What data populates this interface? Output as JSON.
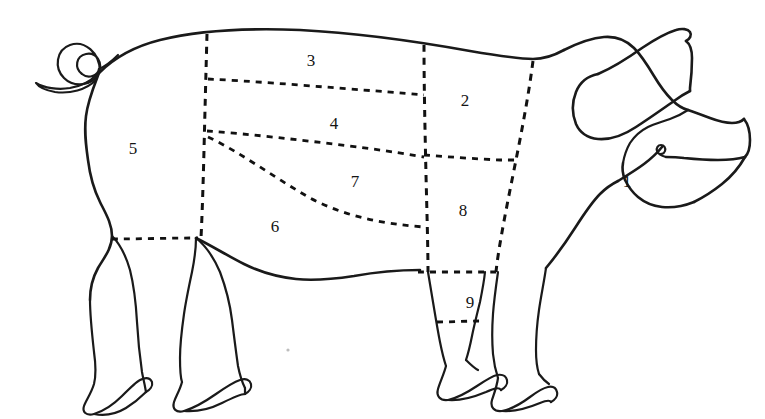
{
  "diagram": {
    "type": "butchery-cuts-outline",
    "background_color": "#ffffff",
    "outline_color": "#1a1a1a",
    "cutline_color": "#111111",
    "cutline_style": "dashed",
    "label_color": "#141414",
    "canvas": {
      "width": 765,
      "height": 419
    }
  },
  "cut_labels": [
    {
      "id": "1",
      "text": "1",
      "x": 627,
      "y": 181
    },
    {
      "id": "2",
      "text": "2",
      "x": 465,
      "y": 100
    },
    {
      "id": "3",
      "text": "3",
      "x": 311,
      "y": 60
    },
    {
      "id": "4",
      "text": "4",
      "x": 334,
      "y": 123
    },
    {
      "id": "5",
      "text": "5",
      "x": 133,
      "y": 148
    },
    {
      "id": "6",
      "text": "6",
      "x": 275,
      "y": 226
    },
    {
      "id": "7",
      "text": "7",
      "x": 355,
      "y": 181
    },
    {
      "id": "8",
      "text": "8",
      "x": 463,
      "y": 210
    },
    {
      "id": "9",
      "text": "9",
      "x": 470,
      "y": 302
    }
  ],
  "body_parts": [
    {
      "name": "tail-curl"
    },
    {
      "name": "back-outline"
    },
    {
      "name": "rear-ham-outline"
    },
    {
      "name": "hind-leg-front"
    },
    {
      "name": "hind-leg-rear"
    },
    {
      "name": "belly-outline"
    },
    {
      "name": "fore-leg-front"
    },
    {
      "name": "fore-leg-rear"
    },
    {
      "name": "head-outline"
    },
    {
      "name": "ear-outline"
    },
    {
      "name": "snout-outline"
    },
    {
      "name": "eye-spiral"
    }
  ],
  "cut_lines": [
    {
      "name": "loin-rear-vertical"
    },
    {
      "name": "loin-upper-horizontal"
    },
    {
      "name": "loin-lower-horizontal"
    },
    {
      "name": "belly-curve"
    },
    {
      "name": "shoulder-rear-vertical"
    },
    {
      "name": "shoulder-front-vertical"
    },
    {
      "name": "shoulder-mid-horizontal"
    },
    {
      "name": "ham-rear-horizontal"
    },
    {
      "name": "hock-upper-horizontal"
    },
    {
      "name": "hock-lower-horizontal"
    }
  ]
}
